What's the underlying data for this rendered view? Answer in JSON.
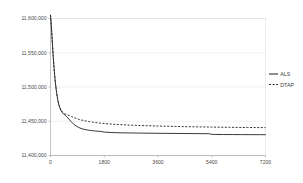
{
  "chart_data": {
    "type": "line",
    "title": "",
    "xlabel": "",
    "ylabel": "",
    "grid": true,
    "legend_position": "right",
    "xlim": [
      0,
      7200
    ],
    "ylim": [
      11400000,
      11600000
    ],
    "x_ticks": [
      0,
      1800,
      3600,
      5400,
      7200
    ],
    "x_tick_labels": [
      "0",
      "1800",
      "3600",
      "5400",
      "7200"
    ],
    "y_ticks": [
      11400000,
      11450000,
      11500000,
      11550000,
      11600000
    ],
    "y_tick_labels": [
      "11,400,000",
      "11,450,000",
      "11,500,000",
      "11,550,000",
      "11,600,000"
    ],
    "series": [
      {
        "name": "ALS",
        "style": "solid",
        "color": "#2e2e2e",
        "x": [
          0,
          30,
          60,
          90,
          120,
          150,
          180,
          210,
          240,
          280,
          320,
          360,
          400,
          450,
          500,
          560,
          620,
          700,
          780,
          860,
          940,
          1020,
          1100,
          1200,
          1300,
          1400,
          1500,
          1600,
          1700,
          1800,
          2000,
          2200,
          2400,
          2700,
          3000,
          3300,
          3600,
          3900,
          4200,
          4500,
          4800,
          5100,
          5300,
          5400,
          5500,
          5800,
          6100,
          6400,
          6700,
          7000,
          7200
        ],
        "y": [
          11605000,
          11588000,
          11566000,
          11545000,
          11527000,
          11512000,
          11500000,
          11490000,
          11482000,
          11474000,
          11469000,
          11465000,
          11462500,
          11460000,
          11458500,
          11456000,
          11453000,
          11449000,
          11445500,
          11443000,
          11441000,
          11439500,
          11438500,
          11437500,
          11436800,
          11436200,
          11435800,
          11435400,
          11435000,
          11434200,
          11433600,
          11433300,
          11433100,
          11432900,
          11432700,
          11432550,
          11432400,
          11432300,
          11432200,
          11432100,
          11432000,
          11431900,
          11431850,
          11430900,
          11430700,
          11430600,
          11430550,
          11430500,
          11430450,
          11430400,
          11430380
        ]
      },
      {
        "name": "DTAP",
        "style": "dashed",
        "color": "#2e2e2e",
        "x": [
          0,
          30,
          60,
          90,
          120,
          150,
          180,
          210,
          240,
          280,
          320,
          360,
          400,
          450,
          500,
          560,
          620,
          700,
          780,
          860,
          940,
          1020,
          1100,
          1200,
          1300,
          1400,
          1500,
          1600,
          1700,
          1800,
          2000,
          2200,
          2400,
          2700,
          3000,
          3300,
          3600,
          3900,
          4200,
          4500,
          4800,
          5100,
          5400,
          5700,
          6000,
          6300,
          6600,
          6900,
          7200
        ],
        "y": [
          11605000,
          11588000,
          11566000,
          11545000,
          11527000,
          11512000,
          11500000,
          11490000,
          11482000,
          11474000,
          11469000,
          11465500,
          11463500,
          11461500,
          11460500,
          11459500,
          11458500,
          11457000,
          11455500,
          11454200,
          11453000,
          11452000,
          11451200,
          11450200,
          11449400,
          11448700,
          11448100,
          11447600,
          11447100,
          11446700,
          11446000,
          11445400,
          11444900,
          11444300,
          11443800,
          11443400,
          11443000,
          11442700,
          11442400,
          11442100,
          11441900,
          11441700,
          11441500,
          11441300,
          11441150,
          11441000,
          11440900,
          11440800,
          11440700
        ]
      }
    ]
  },
  "legend": {
    "items": [
      {
        "label": "ALS"
      },
      {
        "label": "DTAP"
      }
    ]
  }
}
